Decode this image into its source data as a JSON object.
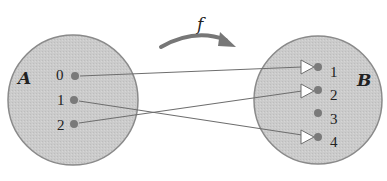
{
  "diagram": {
    "type": "function-mapping",
    "function_label": "f",
    "domain_set": {
      "label": "A",
      "elements": [
        "0",
        "1",
        "2"
      ]
    },
    "codomain_set": {
      "label": "B",
      "elements": [
        "1",
        "2",
        "3",
        "4"
      ]
    },
    "mappings": [
      {
        "from": "0",
        "to": "1"
      },
      {
        "from": "1",
        "to": "4"
      },
      {
        "from": "2",
        "to": "2"
      }
    ],
    "colors": {
      "set_fill": "#c9c9c9",
      "set_stroke": "#8a8a8a",
      "dot": "#7a7a7a",
      "line": "#6e6e6e",
      "arrow_head_fill": "#ffffff",
      "f_arrow": "#777777"
    }
  }
}
